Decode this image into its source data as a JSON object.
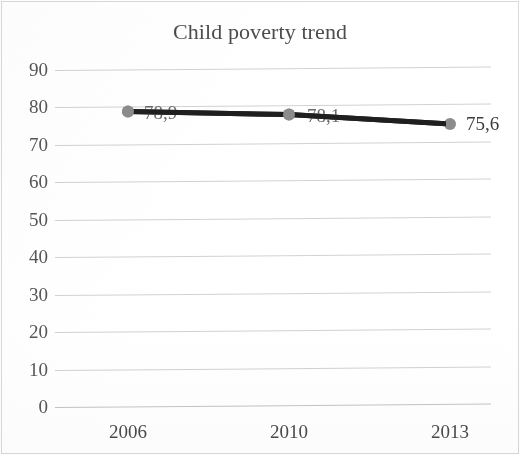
{
  "chart_data": {
    "type": "line",
    "title": "Child poverty trend",
    "xlabel": "",
    "ylabel": "",
    "categories": [
      "2006",
      "2010",
      "2013"
    ],
    "values": [
      78.9,
      78.1,
      75.6
    ],
    "data_labels": [
      "78,9",
      "78,1",
      "75,6"
    ],
    "series": [
      {
        "name": "Child poverty",
        "values": [
          78.9,
          78.1,
          75.6
        ]
      }
    ],
    "ylim": [
      0,
      90
    ],
    "y_ticks": [
      "90",
      "80",
      "70",
      "60",
      "50",
      "40",
      "30",
      "20",
      "10",
      "0"
    ],
    "y_tick_values": [
      90,
      80,
      70,
      60,
      50,
      40,
      30,
      20,
      10,
      0
    ],
    "x_ticks": [
      "2006",
      "2010",
      "2013"
    ],
    "grid": true,
    "grid_axis": "y",
    "legend": false,
    "legend_position": "none",
    "marker": "circle",
    "colors": {
      "line": "#1f1f1f",
      "marker": "#8c8c8c",
      "gridline": "#d2d2d2",
      "title_text": "#4c4c4c",
      "tick_text": "#565656",
      "label_text": "#3d3d3d",
      "background": "#ffffff",
      "border": "#d9d9d9"
    }
  }
}
